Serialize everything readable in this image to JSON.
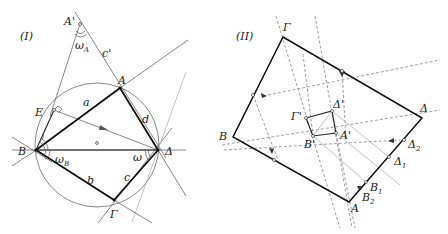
{
  "figures": [
    {
      "id": "I",
      "title": "(I)",
      "points": {
        "A_prime": {
          "label": "A'",
          "x": 80,
          "y": 24
        },
        "A": {
          "label": "A",
          "x": 120,
          "y": 88
        },
        "E": {
          "label": "E",
          "x": 54,
          "y": 110
        },
        "B": {
          "label": "B",
          "x": 36,
          "y": 150
        },
        "Delta": {
          "label": "Δ",
          "x": 158,
          "y": 150
        },
        "Gamma": {
          "label": "Γ",
          "x": 114,
          "y": 200
        },
        "O": {
          "label": "o",
          "x": 97,
          "y": 143
        }
      },
      "segment_labels": {
        "a": "a",
        "b": "b",
        "c": "c",
        "d": "d",
        "c_prime": "c'"
      },
      "angle_labels": {
        "omega_A": "ω",
        "omega_A_sub": "A",
        "omega_B": "ω",
        "omega_B_sub": "B",
        "omega": "ω"
      },
      "circle": {
        "cx": 97,
        "cy": 145,
        "r": 62
      }
    },
    {
      "id": "II",
      "title": "(II)",
      "points": {
        "Gamma": {
          "label": "Γ",
          "x": 283,
          "y": 37
        },
        "Delta": {
          "label": "Δ",
          "x": 422,
          "y": 118
        },
        "A": {
          "label": "A",
          "x": 349,
          "y": 202
        },
        "B": {
          "label": "B",
          "x": 233,
          "y": 137
        },
        "Gamma_prime": {
          "label": "Γ'",
          "x": 306,
          "y": 118
        },
        "Delta_prime": {
          "label": "Δ'",
          "x": 332,
          "y": 111
        },
        "A_prime": {
          "label": "A'",
          "x": 336,
          "y": 133
        },
        "B_prime": {
          "label": "B'",
          "x": 313,
          "y": 136
        },
        "Delta_1": {
          "label": "Δ",
          "sub": "1",
          "x": 389,
          "y": 157
        },
        "Delta_2": {
          "label": "Δ",
          "sub": "2",
          "x": 404,
          "y": 140
        },
        "B_1": {
          "label": "B",
          "sub": "1",
          "x": 366,
          "y": 182
        },
        "B_2": {
          "label": "B",
          "sub": "2",
          "x": 359,
          "y": 190
        }
      }
    }
  ]
}
